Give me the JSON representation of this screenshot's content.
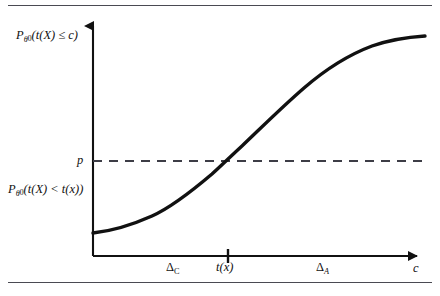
{
  "figure": {
    "kind": "line-plot",
    "background_color": "#ffffff",
    "rules": {
      "top_rule_y": 5,
      "bottom_rule_y": 282,
      "rule_color": "#4a4a52"
    }
  },
  "axes": {
    "x_axis": {
      "origin_x": 93,
      "baseline_y": 256,
      "end_x": 425,
      "has_arrowhead": true,
      "color": "#111111"
    },
    "y_axis": {
      "axis_x": 93,
      "top_y": 18,
      "bottom_y": 256,
      "has_arrowhead": true,
      "color": "#111111"
    }
  },
  "labels": {
    "upper_left": {
      "base": "P",
      "subscript": "θ",
      "subscript_index": "0",
      "expression": "(t(X) ≤ c)",
      "full_text": "Pθ₀(t(X) ≤ c)"
    },
    "lower_left": {
      "base": "P",
      "subscript": "θ",
      "subscript_index": "0",
      "expression": "(t(X) < t(x))",
      "full_text": "Pθ₀(t(X) < t(x))"
    },
    "p_level": "p",
    "x_ticks": [
      {
        "name": "delta-c",
        "text": "Δ",
        "subscript": "C",
        "x": 174,
        "has_tick_mark": false
      },
      {
        "name": "t-of-x",
        "text": "t(x)",
        "subscript": "",
        "x": 228,
        "has_tick_mark": true
      },
      {
        "name": "delta-a",
        "text": "Δ",
        "subscript": "A",
        "x": 324,
        "has_tick_mark": false
      },
      {
        "name": "c-axis-label",
        "text": "c",
        "subscript": "",
        "x": 416,
        "has_tick_mark": false
      }
    ]
  },
  "reference_line": {
    "name": "p-dashed-line",
    "y": 161,
    "x_start": 93,
    "x_end": 428,
    "style": "dashed",
    "color": "#3d3d46",
    "dash_pattern": "9 7"
  },
  "chart_data": {
    "type": "line",
    "title": "",
    "xlabel": "c",
    "ylabel": "",
    "grid": false,
    "legend_position": "none",
    "curve_color": "#111111",
    "curve_width": 3.4,
    "axis_ranges": {
      "x_pixels": [
        93,
        425
      ],
      "y_pixels": [
        256,
        18
      ]
    },
    "annotations": [
      {
        "text": "p",
        "type": "y-reference",
        "y_pixel": 161
      },
      {
        "text": "t(x)",
        "type": "x-tick",
        "x_pixel": 228
      },
      {
        "text": "ΔC",
        "type": "x-region",
        "x_pixel": 174
      },
      {
        "text": "ΔA",
        "type": "x-region",
        "x_pixel": 324
      }
    ],
    "x": [
      93,
      110,
      128,
      146,
      164,
      182,
      200,
      214,
      228,
      242,
      260,
      278,
      296,
      314,
      332,
      350,
      370,
      390,
      408,
      425
    ],
    "y": [
      233,
      230,
      226,
      221,
      214,
      205,
      194,
      183,
      161,
      148,
      130,
      112,
      95,
      81,
      68,
      58,
      48,
      42,
      38,
      36
    ],
    "path_d": "M 93 233 C 112 231 134 224 152 216 C 172 207 192 191 212 174 C 221 166 231 156 242 146 C 262 127 282 107 304 88 C 326 69 348 55 372 46 C 392 39 410 37 425 36"
  }
}
